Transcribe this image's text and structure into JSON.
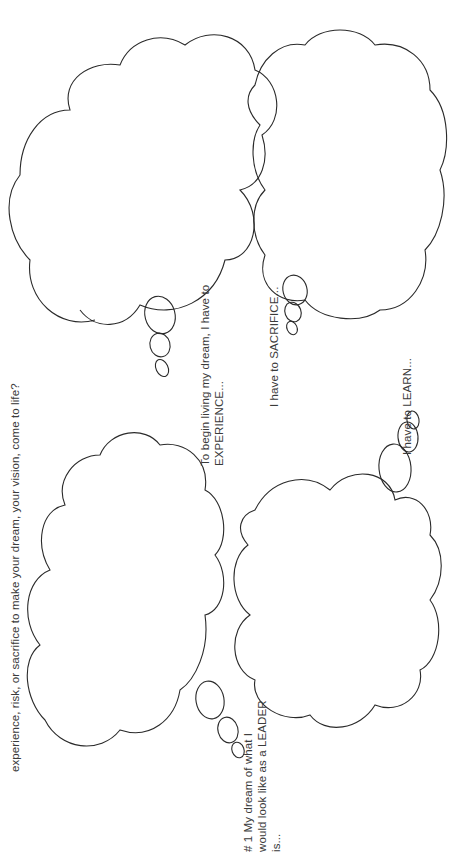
{
  "worksheet": {
    "question": {
      "line_clipped": "What will you need to learn, do, or change? What",
      "line_visible": "experience, risk, or sacrifice to make your dream, your vision, come to life?"
    },
    "prompts": {
      "leader": {
        "lines": [
          "# 1 My dream of what I",
          "would look like as a LEADER",
          "is..."
        ]
      },
      "experience": {
        "lines": [
          "To begin living my dream, I have to",
          "EXPERIENCE..."
        ]
      },
      "sacrifice": {
        "lines": [
          "I have to SACRIFICE..."
        ]
      },
      "learn": {
        "lines": [
          "I have to LEARN..."
        ]
      }
    },
    "colors": {
      "background": "#ffffff",
      "stroke": "#2a2a2a",
      "text": "#3a3a3a"
    }
  }
}
